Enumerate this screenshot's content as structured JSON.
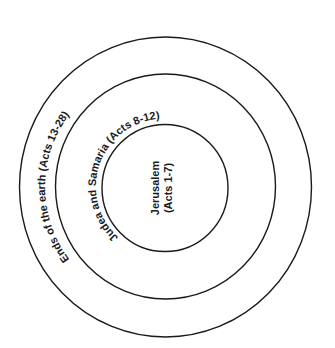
{
  "diagram": {
    "type": "concentric-circles",
    "background": "#ffffff",
    "stroke_color": "#1a1a1a",
    "rings": [
      {
        "id": "outer",
        "label": "Ends of the earth (Acts 13-28)"
      },
      {
        "id": "middle",
        "label": "Judea and Samaria (Acts 8-12)"
      },
      {
        "id": "inner",
        "label_line1": "Jerusalem",
        "label_line2": "(Acts 1-7)"
      }
    ]
  }
}
